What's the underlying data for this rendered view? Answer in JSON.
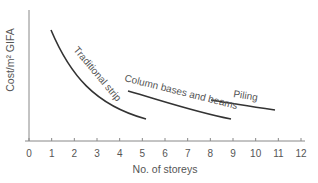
{
  "chart_data": {
    "type": "line",
    "title": "",
    "xlabel": "No. of storeys",
    "ylabel": "Cost/m² GIFA",
    "xlim": [
      0,
      12
    ],
    "x_ticks": [
      "0",
      "1",
      "2",
      "3",
      "4",
      "5",
      "6",
      "7",
      "8",
      "9",
      "10",
      "11",
      "12"
    ],
    "y_ticks": [],
    "grid": false,
    "legend": "none (inline curve labels)",
    "series": [
      {
        "name": "Traditional strip",
        "x": [
          1,
          2,
          3,
          4,
          5.2
        ],
        "y_relative": [
          0.88,
          0.62,
          0.42,
          0.28,
          0.18
        ]
      },
      {
        "name": "Column bases and beams",
        "x": [
          4.4,
          6,
          7.5,
          9
        ],
        "y_relative": [
          0.4,
          0.32,
          0.25,
          0.18
        ]
      },
      {
        "name": "Piling",
        "x": [
          8,
          9.5,
          11
        ],
        "y_relative": [
          0.32,
          0.28,
          0.24
        ]
      }
    ]
  },
  "labels": {
    "xlabel": "No. of storeys",
    "ylabel": "Cost/m² GIFA",
    "series_0": "Traditional strip",
    "series_1": "Column bases and beams",
    "series_2": "Piling"
  }
}
